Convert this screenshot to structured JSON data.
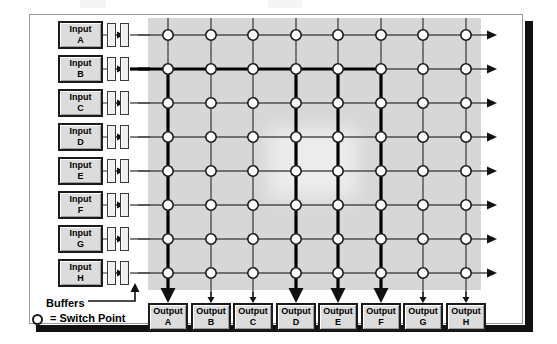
{
  "diagram": {
    "inputs": [
      {
        "label": "Input",
        "id": "A"
      },
      {
        "label": "Input",
        "id": "B"
      },
      {
        "label": "Input",
        "id": "C"
      },
      {
        "label": "Input",
        "id": "D"
      },
      {
        "label": "Input",
        "id": "E"
      },
      {
        "label": "Input",
        "id": "F"
      },
      {
        "label": "Input",
        "id": "G"
      },
      {
        "label": "Input",
        "id": "H"
      }
    ],
    "outputs": [
      {
        "label": "Output",
        "id": "A"
      },
      {
        "label": "Output",
        "id": "B"
      },
      {
        "label": "Output",
        "id": "C"
      },
      {
        "label": "Output",
        "id": "D"
      },
      {
        "label": "Output",
        "id": "E"
      },
      {
        "label": "Output",
        "id": "F"
      },
      {
        "label": "Output",
        "id": "G"
      },
      {
        "label": "Output",
        "id": "H"
      }
    ],
    "legend": {
      "buffers_label": "Buffers",
      "switch_point_label": "= Switch Point"
    },
    "active_row": "B",
    "active_columns": [
      "A",
      "D",
      "E",
      "F"
    ],
    "colors": {
      "field_shade": "#d7d7d7",
      "box_fill": "#dcdcdc",
      "line": "#4d4d4d",
      "active_line": "#000000",
      "border": "#1b1b1b"
    },
    "geometry": {
      "row_y": [
        35,
        69,
        103,
        137,
        171,
        205,
        239,
        273
      ],
      "col_x": [
        168,
        211,
        253,
        296,
        338,
        381,
        423,
        466
      ],
      "field": {
        "x": 148,
        "y": 18,
        "w": 333,
        "h": 272
      }
    }
  }
}
